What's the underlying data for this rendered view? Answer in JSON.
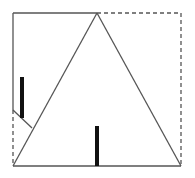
{
  "diagram": {
    "colors": {
      "line": "#555555",
      "bar": "#111111",
      "background": "#ffffff"
    },
    "square": {
      "left": 13,
      "top": 13,
      "right": 181,
      "bottom": 166
    },
    "triangle": {
      "apex": [
        97,
        13
      ],
      "base_left": [
        13,
        166
      ],
      "base_right": [
        181,
        166
      ]
    },
    "fold_point_left_edge": [
      13,
      110
    ],
    "fold_end": [
      32,
      128
    ],
    "bars": [
      {
        "name": "left-height-bar",
        "x": 22,
        "y1": 77,
        "y2": 118
      },
      {
        "name": "center-height-bar",
        "x": 97,
        "y1": 126,
        "y2": 166
      }
    ]
  }
}
